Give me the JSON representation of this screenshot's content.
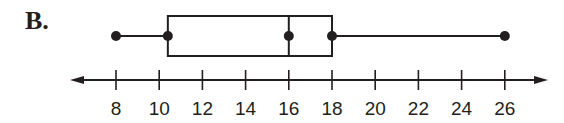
{
  "option_label": "B.",
  "colors": {
    "ink": "#231f20",
    "background": "#ffffff"
  },
  "chart_data": {
    "type": "boxplot",
    "title": "",
    "xlabel": "",
    "ylabel": "",
    "min": 8,
    "q1": 10.4,
    "median": 16,
    "q3": 18,
    "max": 26,
    "axis": {
      "ticks": [
        8,
        10,
        12,
        14,
        16,
        18,
        20,
        22,
        24,
        26
      ],
      "tick_labels": [
        "8",
        "10",
        "12",
        "14",
        "16",
        "18",
        "20",
        "22",
        "24",
        "26"
      ],
      "arrows_both_ends": true
    },
    "grid": false
  }
}
